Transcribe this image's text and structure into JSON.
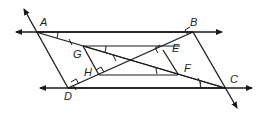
{
  "figure": {
    "type": "geometry-diagram",
    "points": {
      "A": {
        "label": "A",
        "x": 36,
        "y": 32
      },
      "B": {
        "label": "B",
        "x": 193,
        "y": 32
      },
      "C": {
        "label": "C",
        "x": 225,
        "y": 88
      },
      "D": {
        "label": "D",
        "x": 68,
        "y": 88
      },
      "G": {
        "label": "G",
        "x": 83,
        "y": 46
      },
      "H": {
        "label": "H",
        "x": 99,
        "y": 75
      },
      "E": {
        "label": "E",
        "x": 163,
        "y": 50
      },
      "F": {
        "label": "F",
        "x": 178,
        "y": 74
      }
    },
    "labels": [
      "A",
      "B",
      "C",
      "D",
      "E",
      "F",
      "G",
      "H"
    ],
    "marks": {
      "right_angles": [
        "D",
        "H",
        "E",
        "B"
      ],
      "tick_marks": [
        "AG",
        "GC",
        "AF",
        "FC"
      ],
      "arc_angles": [
        "A",
        "G",
        "F",
        "C"
      ]
    }
  }
}
